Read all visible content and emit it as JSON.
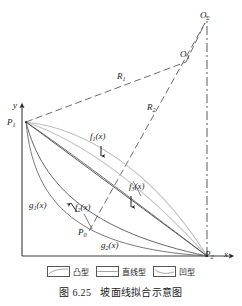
{
  "figure": {
    "caption_number": "图 6.25",
    "caption_text": "坡面线拟合示意图",
    "axes": {
      "y_axis_label": "y",
      "x_axis_label": "x"
    },
    "points": [
      {
        "id": "P1",
        "base": "P",
        "sub": "1",
        "desc": "slope-crest point on y-axis"
      },
      {
        "id": "P0",
        "base": "P",
        "sub": "0",
        "desc": "intermediate control point"
      },
      {
        "id": "P2",
        "base": "P",
        "sub": "2",
        "desc": "slope-toe point on x-axis"
      },
      {
        "id": "O1",
        "base": "O",
        "sub": "1",
        "desc": "first arc center"
      },
      {
        "id": "O2",
        "base": "O",
        "sub": "2",
        "desc": "second arc center"
      }
    ],
    "radii": [
      {
        "id": "R1",
        "base": "R",
        "sub": "1",
        "desc": "radius from O1 to P1"
      },
      {
        "id": "R2",
        "base": "R",
        "sub": "2",
        "desc": "radius from O2 to P0"
      }
    ],
    "curve_labels": [
      {
        "id": "f1",
        "base": "f",
        "sub": "1",
        "arg": "(x)",
        "desc": "convex curve upper"
      },
      {
        "id": "f2",
        "base": "f",
        "sub": "2",
        "arg": "(x)",
        "desc": "convex curve lower"
      },
      {
        "id": "f3",
        "base": "f",
        "sub": "3",
        "arg": "(x)",
        "desc": "convex curve middle-right"
      },
      {
        "id": "g1",
        "base": "g",
        "sub": "1",
        "arg": "(x)",
        "desc": "concave curve upper-left"
      },
      {
        "id": "g2",
        "base": "g",
        "sub": "2",
        "arg": "(x)",
        "desc": "concave curve lower"
      }
    ],
    "legend": [
      {
        "id": "convex",
        "label": "凸型",
        "icon": "convex-curve-swatch"
      },
      {
        "id": "straight",
        "label": "直线型",
        "icon": "straight-line-swatch"
      },
      {
        "id": "concave",
        "label": "凹型",
        "icon": "concave-curve-swatch"
      }
    ],
    "colors": {
      "axis": "#3a3a3a",
      "curve_dark": "#4a4a4a",
      "curve_light": "#b9b9b9",
      "dashed": "#5a5a5a",
      "text": "#1a1a1a"
    }
  }
}
